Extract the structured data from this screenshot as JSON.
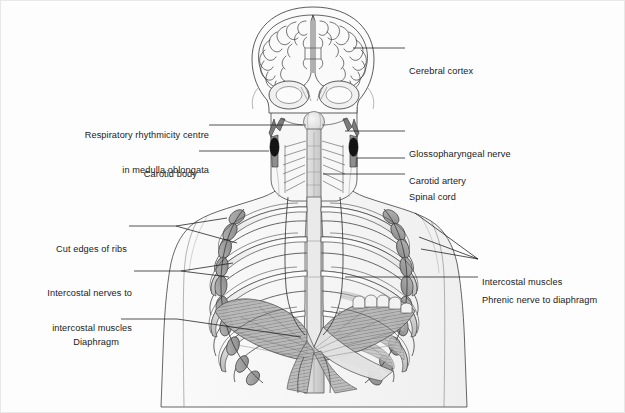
{
  "figure": {
    "background_color": "#fdfdfd",
    "ink_color": "#1a1a1a",
    "line_color": "#3a3a3a",
    "fill_light": "#f3f3f3",
    "fill_mid": "#c9c9c9",
    "fill_dark": "#8d8d8d",
    "fill_black": "#141414"
  },
  "labels": {
    "left": [
      {
        "id": "respiratory-rhythmicity-centre",
        "lines": [
          "Respiratory rhythmicity centre",
          "in medulla oblongata"
        ],
        "x": 48,
        "y": 106,
        "align": "right",
        "leader_to": [
          295,
          124
        ]
      },
      {
        "id": "carotid-body",
        "lines": [
          "Carotid body"
        ],
        "x": 124,
        "y": 146,
        "align": "right",
        "leader_to": [
          268,
          150
        ]
      },
      {
        "id": "cut-edges-of-ribs",
        "lines": [
          "Cut edges of ribs"
        ],
        "x": 33,
        "y": 222,
        "align": "right",
        "leader_to": [
          225,
          245
        ]
      },
      {
        "id": "intercostal-nerves",
        "lines": [
          "Intercostal nerves to",
          "intercostal muscles"
        ],
        "x": 17,
        "y": 264,
        "align": "right",
        "leader_to": [
          232,
          268
        ]
      },
      {
        "id": "diaphragm",
        "lines": [
          "Diaphragm"
        ],
        "x": 59,
        "y": 315,
        "align": "right",
        "leader_to": [
          300,
          330
        ]
      }
    ],
    "right": [
      {
        "id": "cerebral-cortex",
        "lines": [
          "Cerebral cortex"
        ],
        "x": 408,
        "y": 43,
        "align": "left",
        "leader_to": [
          351,
          48
        ]
      },
      {
        "id": "glossopharyngeal-nerve",
        "lines": [
          "Glossopharyngeal nerve"
        ],
        "x": 408,
        "y": 129,
        "align": "left",
        "leader_to": [
          341,
          130
        ]
      },
      {
        "id": "carotid-artery",
        "lines": [
          "Carotid artery"
        ],
        "x": 408,
        "y": 155,
        "align": "left",
        "leader_to": [
          339,
          158
        ]
      },
      {
        "id": "spinal-cord",
        "lines": [
          "Spinal cord"
        ],
        "x": 408,
        "y": 172,
        "align": "left",
        "leader_to": [
          303,
          172
        ]
      },
      {
        "id": "intercostal-muscles",
        "lines": [
          "Intercostal muscles"
        ],
        "x": 481,
        "y": 256,
        "align": "left",
        "leader_to": [
          400,
          232
        ]
      },
      {
        "id": "phrenic-nerve-to-diaphragm",
        "lines": [
          "Phrenic nerve to diaphragm"
        ],
        "x": 481,
        "y": 274,
        "align": "left",
        "leader_to": [
          380,
          278
        ]
      }
    ]
  },
  "structures": [
    {
      "id": "skull",
      "name": "Skull / head outline"
    },
    {
      "id": "cerebral-cortex",
      "name": "Cerebral cortex (coronal section)"
    },
    {
      "id": "cerebellum",
      "name": "Cerebellum"
    },
    {
      "id": "medulla-oblongata",
      "name": "Medulla oblongata (respiratory rhythmicity centre)"
    },
    {
      "id": "spinal-cord",
      "name": "Spinal cord"
    },
    {
      "id": "carotid-artery-left",
      "name": "Left carotid artery"
    },
    {
      "id": "carotid-artery-right",
      "name": "Right carotid artery"
    },
    {
      "id": "carotid-body-left",
      "name": "Left carotid body"
    },
    {
      "id": "carotid-body-right",
      "name": "Right carotid body"
    },
    {
      "id": "glossopharyngeal-nerve",
      "name": "Glossopharyngeal nerve"
    },
    {
      "id": "rib-cage",
      "name": "Rib cage with cut rib edges"
    },
    {
      "id": "sternum",
      "name": "Sternum"
    },
    {
      "id": "vertebral-column",
      "name": "Vertebral column"
    },
    {
      "id": "intercostal-muscles",
      "name": "Intercostal muscles"
    },
    {
      "id": "intercostal-nerves",
      "name": "Intercostal nerves"
    },
    {
      "id": "phrenic-nerve",
      "name": "Phrenic nerve"
    },
    {
      "id": "diaphragm",
      "name": "Diaphragm"
    },
    {
      "id": "torso-outline",
      "name": "Torso and shoulder outline"
    }
  ]
}
